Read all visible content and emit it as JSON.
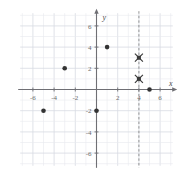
{
  "chart_data": {
    "type": "scatter",
    "title": "",
    "xlabel": "x",
    "ylabel": "y",
    "xlim": [
      -7.2,
      7.2
    ],
    "ylim": [
      -7.2,
      7.2
    ],
    "grid": true,
    "grid_step": 1,
    "legend": "none",
    "x_ticks": [
      -6,
      -4,
      -2,
      2,
      4,
      6
    ],
    "y_ticks": [
      6,
      4,
      2,
      -2,
      -4,
      -6
    ],
    "x_tick_labels": [
      "-6",
      "-4",
      "-2",
      "2",
      "4",
      "6"
    ],
    "y_tick_labels": [
      "6",
      "4",
      "2",
      "-2",
      "-4",
      "-6"
    ],
    "series": [
      {
        "name": "points",
        "marker": "filled-circle",
        "color": "#333333",
        "points": [
          {
            "x": -5,
            "y": -2
          },
          {
            "x": -3,
            "y": 2
          },
          {
            "x": 0,
            "y": -2
          },
          {
            "x": 1,
            "y": 4
          },
          {
            "x": 5,
            "y": 0
          }
        ]
      },
      {
        "name": "marked-points",
        "marker": "x-star",
        "color": "#3a3a3a",
        "points": [
          {
            "x": 4,
            "y": 3
          },
          {
            "x": 4,
            "y": 1
          }
        ]
      }
    ],
    "annotations": [
      {
        "type": "vertical-line",
        "style": "dashed",
        "x": 4,
        "color": "#8a8a8a",
        "label": ""
      }
    ]
  },
  "axis_labels": {
    "x": "x",
    "y": "y"
  },
  "colors": {
    "grid": "#d8dbe2",
    "grid_minor": "#e8eaee",
    "axis": "#6f6f74",
    "point": "#333333",
    "marker": "#3a3a3a",
    "dashed_line": "#8a8a8a",
    "tick_text": "#6b6b6b",
    "background": "#ffffff"
  }
}
